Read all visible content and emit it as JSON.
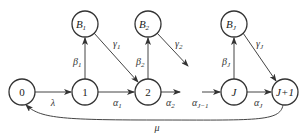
{
  "diagram": {
    "type": "state-transition",
    "nodes": [
      {
        "id": "n0",
        "label": "0",
        "sub": ""
      },
      {
        "id": "n1",
        "label": "1",
        "sub": ""
      },
      {
        "id": "n2",
        "label": "2",
        "sub": ""
      },
      {
        "id": "nJ",
        "label": "J",
        "sub": ""
      },
      {
        "id": "nJ1",
        "label": "J+1",
        "sub": ""
      },
      {
        "id": "B1",
        "label": "B",
        "sub": "1"
      },
      {
        "id": "B2",
        "label": "B",
        "sub": "2"
      },
      {
        "id": "BJ",
        "label": "B",
        "sub": "J"
      }
    ],
    "edges": [
      {
        "from": "n0",
        "to": "n1",
        "label": "λ",
        "sub": ""
      },
      {
        "from": "n1",
        "to": "n2",
        "label": "α",
        "sub": "1"
      },
      {
        "from": "n2",
        "to": "…",
        "label": "α",
        "sub": "2"
      },
      {
        "from": "…",
        "to": "nJ",
        "label": "α",
        "sub": "J−1"
      },
      {
        "from": "nJ",
        "to": "nJ1",
        "label": "α",
        "sub": "J"
      },
      {
        "from": "n1",
        "to": "B1",
        "label": "β",
        "sub": "1"
      },
      {
        "from": "n2",
        "to": "B2",
        "label": "β",
        "sub": "2"
      },
      {
        "from": "nJ",
        "to": "BJ",
        "label": "β",
        "sub": "J"
      },
      {
        "from": "B1",
        "to": "n2",
        "label": "γ",
        "sub": "1"
      },
      {
        "from": "B2",
        "to": "…",
        "label": "γ",
        "sub": "2"
      },
      {
        "from": "BJ",
        "to": "nJ1",
        "label": "γ",
        "sub": "J"
      },
      {
        "from": "nJ1",
        "to": "n0",
        "label": "μ",
        "sub": ""
      }
    ]
  }
}
